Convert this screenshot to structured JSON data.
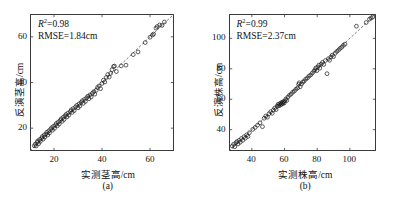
{
  "figure": {
    "panel_count": 2,
    "marker_style": "open-circle",
    "reference_line": "1:1 dashed line",
    "axis_units": "cm"
  },
  "panels": [
    {
      "caption": "(a)",
      "xlabel": "实测茎高/cm",
      "ylabel": "反演茎高/cm",
      "r2_prefix": "R",
      "r2_sup": "2",
      "r2_text": "=0.98",
      "rmse_text": "RMSE=1.84cm",
      "xticks": [
        "20",
        "40",
        "60"
      ],
      "yticks": [
        "20",
        "40",
        "60"
      ]
    },
    {
      "caption": "(b)",
      "xlabel": "实测株高/cm",
      "ylabel": "反演株高/cm",
      "r2_prefix": "R",
      "r2_sup": "2",
      "r2_text": "=0.99",
      "rmse_text": "RMSE=2.37cm",
      "xticks": [
        "40",
        "60",
        "80",
        "100"
      ],
      "yticks": [
        "40",
        "60",
        "80",
        "100"
      ]
    }
  ],
  "chart_data": [
    {
      "type": "scatter",
      "title": "(a)",
      "xlabel": "实测茎高/cm",
      "ylabel": "反演茎高/cm",
      "xlim": [
        10,
        70
      ],
      "ylim": [
        10,
        70
      ],
      "xticks": [
        20,
        40,
        60
      ],
      "yticks": [
        20,
        40,
        60
      ],
      "grid": false,
      "legend": null,
      "annotations": [
        "R2=0.98",
        "RMSE=1.84cm"
      ],
      "reference_line": {
        "type": "1:1",
        "style": "dashed",
        "from": [
          10,
          10
        ],
        "to": [
          70,
          70
        ]
      },
      "r_squared": 0.98,
      "rmse": 1.84,
      "points": [
        [
          11.8,
          12.3
        ],
        [
          12.2,
          13.0
        ],
        [
          12.6,
          12.2
        ],
        [
          13.0,
          13.8
        ],
        [
          13.2,
          14.4
        ],
        [
          13.6,
          13.2
        ],
        [
          14.0,
          15.0
        ],
        [
          14.3,
          14.2
        ],
        [
          14.8,
          15.6
        ],
        [
          15.1,
          16.3
        ],
        [
          15.5,
          15.2
        ],
        [
          15.9,
          17.0
        ],
        [
          16.2,
          16.1
        ],
        [
          16.6,
          17.4
        ],
        [
          17.0,
          18.2
        ],
        [
          17.4,
          17.0
        ],
        [
          17.8,
          18.8
        ],
        [
          18.1,
          17.9
        ],
        [
          18.6,
          19.5
        ],
        [
          19.0,
          20.2
        ],
        [
          19.4,
          19.1
        ],
        [
          19.8,
          20.8
        ],
        [
          20.2,
          19.9
        ],
        [
          20.6,
          21.4
        ],
        [
          21.0,
          22.1
        ],
        [
          21.4,
          21.0
        ],
        [
          21.8,
          22.7
        ],
        [
          22.2,
          21.8
        ],
        [
          22.6,
          23.4
        ],
        [
          23.0,
          24.1
        ],
        [
          23.4,
          23.0
        ],
        [
          23.8,
          24.7
        ],
        [
          24.2,
          23.8
        ],
        [
          24.6,
          25.3
        ],
        [
          25.0,
          26.0
        ],
        [
          25.4,
          24.9
        ],
        [
          25.8,
          26.6
        ],
        [
          26.2,
          25.7
        ],
        [
          26.8,
          27.3
        ],
        [
          27.2,
          28.0
        ],
        [
          27.6,
          26.9
        ],
        [
          28.0,
          28.6
        ],
        [
          28.4,
          27.7
        ],
        [
          29.0,
          29.3
        ],
        [
          29.5,
          30.0
        ],
        [
          30.0,
          28.9
        ],
        [
          30.4,
          30.6
        ],
        [
          30.8,
          29.7
        ],
        [
          31.3,
          31.3
        ],
        [
          31.8,
          32.0
        ],
        [
          32.2,
          30.9
        ],
        [
          32.7,
          32.6
        ],
        [
          33.1,
          31.7
        ],
        [
          33.6,
          33.3
        ],
        [
          34.1,
          34.0
        ],
        [
          34.6,
          32.9
        ],
        [
          35.0,
          34.6
        ],
        [
          35.5,
          33.7
        ],
        [
          36.0,
          35.3
        ],
        [
          36.6,
          36.0
        ],
        [
          37.0,
          34.9
        ],
        [
          37.6,
          36.6
        ],
        [
          38.1,
          37.8
        ],
        [
          38.8,
          38.5
        ],
        [
          39.4,
          37.3
        ],
        [
          40.0,
          39.6
        ],
        [
          40.6,
          41.0
        ],
        [
          41.2,
          40.2
        ],
        [
          41.8,
          42.2
        ],
        [
          42.4,
          43.5
        ],
        [
          43.0,
          42.4
        ],
        [
          43.6,
          44.0
        ],
        [
          44.2,
          45.6
        ],
        [
          44.8,
          47.0
        ],
        [
          45.2,
          47.2
        ],
        [
          46.0,
          44.8
        ],
        [
          48.0,
          47.3
        ],
        [
          50.0,
          47.6
        ],
        [
          53.0,
          52.2
        ],
        [
          55.0,
          53.4
        ],
        [
          58.0,
          57.5
        ],
        [
          60.0,
          59.8
        ],
        [
          61.0,
          60.8
        ],
        [
          61.5,
          61.2
        ],
        [
          62.5,
          63.8
        ],
        [
          63.0,
          64.5
        ],
        [
          64.0,
          65.2
        ],
        [
          65.0,
          65.0
        ],
        [
          66.0,
          66.5
        ]
      ]
    },
    {
      "type": "scatter",
      "title": "(b)",
      "xlabel": "实测株高/cm",
      "ylabel": "反演株高/cm",
      "xlim": [
        26,
        116
      ],
      "ylim": [
        26,
        116
      ],
      "xticks": [
        40,
        60,
        80,
        100
      ],
      "yticks": [
        40,
        60,
        80,
        100
      ],
      "grid": false,
      "legend": null,
      "annotations": [
        "R2=0.99",
        "RMSE=2.37cm"
      ],
      "reference_line": {
        "type": "1:1",
        "style": "dashed",
        "from": [
          26,
          26
        ],
        "to": [
          116,
          116
        ]
      },
      "r_squared": 0.99,
      "rmse": 2.37,
      "points": [
        [
          28.0,
          29.2
        ],
        [
          28.8,
          30.4
        ],
        [
          29.5,
          28.8
        ],
        [
          30.2,
          31.4
        ],
        [
          30.9,
          32.2
        ],
        [
          31.5,
          30.6
        ],
        [
          32.2,
          33.0
        ],
        [
          32.9,
          31.8
        ],
        [
          33.6,
          34.2
        ],
        [
          34.4,
          33.0
        ],
        [
          35.2,
          35.4
        ],
        [
          36.0,
          34.4
        ],
        [
          36.8,
          36.6
        ],
        [
          37.6,
          35.6
        ],
        [
          38.5,
          38.0
        ],
        [
          40.5,
          40.2
        ],
        [
          42.0,
          41.5
        ],
        [
          43.5,
          43.0
        ],
        [
          45.0,
          44.5
        ],
        [
          46.5,
          42.0
        ],
        [
          47.5,
          47.5
        ],
        [
          48.5,
          49.0
        ],
        [
          49.5,
          48.2
        ],
        [
          50.5,
          50.5
        ],
        [
          51.5,
          51.8
        ],
        [
          52.5,
          50.8
        ],
        [
          53.2,
          53.0
        ],
        [
          54.0,
          54.2
        ],
        [
          54.8,
          53.2
        ],
        [
          55.5,
          55.4
        ],
        [
          56.0,
          56.6
        ],
        [
          56.5,
          55.6
        ],
        [
          57.0,
          57.0
        ],
        [
          57.4,
          56.2
        ],
        [
          57.8,
          57.6
        ],
        [
          58.2,
          56.8
        ],
        [
          58.6,
          58.0
        ],
        [
          59.0,
          57.2
        ],
        [
          59.4,
          58.4
        ],
        [
          59.8,
          57.5
        ],
        [
          60.2,
          59.0
        ],
        [
          60.8,
          60.2
        ],
        [
          61.4,
          59.2
        ],
        [
          62.0,
          61.4
        ],
        [
          63.0,
          62.6
        ],
        [
          64.0,
          63.4
        ],
        [
          65.0,
          64.6
        ],
        [
          66.0,
          65.4
        ],
        [
          67.0,
          66.6
        ],
        [
          68.0,
          67.4
        ],
        [
          68.6,
          69.8
        ],
        [
          69.0,
          70.8
        ],
        [
          69.6,
          68.2
        ],
        [
          70.4,
          70.0
        ],
        [
          71.2,
          71.2
        ],
        [
          72.0,
          72.0
        ],
        [
          73.0,
          73.2
        ],
        [
          74.0,
          74.0
        ],
        [
          75.0,
          75.2
        ],
        [
          76.0,
          76.0
        ],
        [
          77.0,
          77.2
        ],
        [
          78.0,
          78.4
        ],
        [
          78.6,
          79.4
        ],
        [
          79.2,
          80.6
        ],
        [
          79.8,
          78.8
        ],
        [
          80.4,
          81.2
        ],
        [
          81.0,
          82.4
        ],
        [
          81.6,
          80.4
        ],
        [
          82.4,
          83.0
        ],
        [
          83.2,
          84.2
        ],
        [
          84.0,
          82.8
        ],
        [
          85.0,
          85.4
        ],
        [
          86.0,
          76.8
        ],
        [
          86.8,
          86.6
        ],
        [
          87.6,
          85.6
        ],
        [
          88.4,
          87.8
        ],
        [
          89.2,
          89.0
        ],
        [
          90.0,
          88.0
        ],
        [
          91.0,
          90.2
        ],
        [
          92.0,
          91.4
        ],
        [
          93.0,
          92.2
        ],
        [
          94.0,
          93.4
        ],
        [
          95.0,
          94.2
        ],
        [
          96.0,
          95.4
        ],
        [
          97.0,
          96.2
        ],
        [
          104.0,
          108.0
        ],
        [
          110.0,
          110.4
        ],
        [
          112.0,
          112.6
        ],
        [
          113.0,
          113.4
        ],
        [
          114.0,
          114.0
        ]
      ]
    }
  ]
}
